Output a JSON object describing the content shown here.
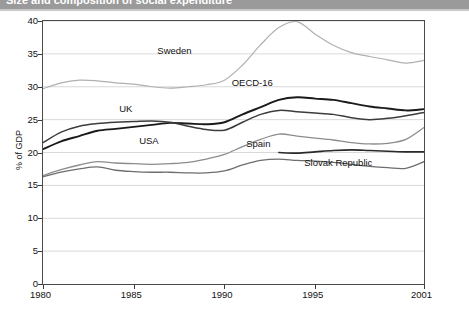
{
  "header": {
    "title": "Size and composition of social expenditure",
    "accent_color": "#9a9a9a"
  },
  "chart_data": {
    "type": "line",
    "title": "",
    "xlabel": "",
    "ylabel": "% of GDP",
    "xlim": [
      1980,
      2001
    ],
    "ylim": [
      0,
      40
    ],
    "yticks": [
      0,
      5,
      10,
      15,
      20,
      25,
      30,
      35,
      40
    ],
    "xticks": [
      1980,
      1985,
      1990,
      1995,
      2001
    ],
    "grid": true,
    "legend": "inline-annotations",
    "x": [
      1980,
      1981,
      1982,
      1983,
      1984,
      1985,
      1986,
      1987,
      1988,
      1989,
      1990,
      1991,
      1992,
      1993,
      1994,
      1995,
      1996,
      1997,
      1998,
      1999,
      2000,
      2001
    ],
    "series": [
      {
        "name": "Sweden",
        "color": "#b0b0b0",
        "width": 1.2,
        "label_x": 1986.3,
        "label_y": 35.4,
        "values": [
          29.7,
          30.6,
          31.0,
          30.9,
          30.6,
          30.4,
          30.0,
          29.8,
          30.0,
          30.3,
          31.0,
          33.3,
          36.4,
          39.0,
          39.9,
          38.0,
          36.3,
          35.2,
          34.6,
          34.1,
          33.6,
          34.0
        ]
      },
      {
        "name": "OECD-16",
        "color": "#1a1a1a",
        "width": 1.9,
        "label_x": 1990.4,
        "label_y": 30.6,
        "values": [
          20.5,
          21.7,
          22.5,
          23.3,
          23.6,
          23.9,
          24.2,
          24.5,
          24.4,
          24.3,
          24.6,
          25.8,
          26.9,
          28.0,
          28.4,
          28.2,
          28.0,
          27.5,
          27.0,
          26.7,
          26.4,
          26.6
        ]
      },
      {
        "name": "UK",
        "color": "#3c3c3c",
        "width": 1.5,
        "label_x": 1984.2,
        "label_y": 26.6,
        "values": [
          21.5,
          23.1,
          24.0,
          24.4,
          24.6,
          24.7,
          24.8,
          24.6,
          24.0,
          23.5,
          23.4,
          24.6,
          25.8,
          26.4,
          26.2,
          26.0,
          25.8,
          25.3,
          25.0,
          25.2,
          25.6,
          26.1
        ]
      },
      {
        "name": "Spain",
        "color": "#8c8c8c",
        "width": 1.3,
        "label_x": 1991.2,
        "label_y": 21.3,
        "values": [
          16.5,
          17.4,
          18.1,
          18.6,
          18.4,
          18.3,
          18.2,
          18.3,
          18.5,
          19.0,
          19.7,
          20.9,
          22.0,
          22.8,
          22.5,
          22.2,
          21.9,
          21.5,
          21.3,
          21.4,
          22.0,
          23.8
        ]
      },
      {
        "name": "USA",
        "color": "#6e6e6e",
        "width": 1.3,
        "label_x": 1985.3,
        "label_y": 21.7,
        "values": [
          16.3,
          17.0,
          17.5,
          17.8,
          17.3,
          17.1,
          17.0,
          17.0,
          16.9,
          16.9,
          17.2,
          18.1,
          18.8,
          19.0,
          18.8,
          18.7,
          18.5,
          18.2,
          17.9,
          17.7,
          17.6,
          18.6
        ]
      },
      {
        "name": "Slovak Republic",
        "color": "#2a2a2a",
        "width": 1.6,
        "label_x": 1994.4,
        "label_y": 18.4,
        "start_year": 1993,
        "values": [
          null,
          null,
          null,
          null,
          null,
          null,
          null,
          null,
          null,
          null,
          null,
          null,
          null,
          20.0,
          19.9,
          20.1,
          20.3,
          20.4,
          20.3,
          20.2,
          20.1,
          20.1
        ]
      }
    ]
  }
}
